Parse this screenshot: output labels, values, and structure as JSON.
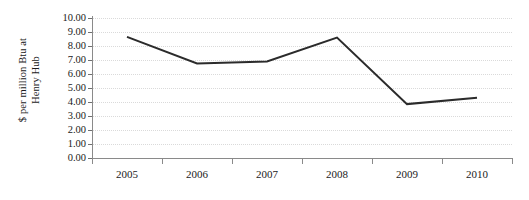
{
  "chart_data": {
    "type": "line",
    "title": "",
    "subtitle": "",
    "xlabel": "",
    "ylabel": "$ per million Btu at Henry Hub",
    "ylabel_lines": [
      "$ per million Btu at",
      "Henry Hub"
    ],
    "categories": [
      "2005",
      "2006",
      "2007",
      "2008",
      "2009",
      "2010"
    ],
    "series": [
      {
        "name": "Henry Hub natural gas price",
        "values": [
          8.65,
          6.75,
          6.9,
          8.6,
          3.85,
          4.3
        ],
        "color": "#2b2b2b"
      }
    ],
    "ylim": [
      0,
      10
    ],
    "ytick_step": 1,
    "ytick_labels": [
      "10.00",
      "9.00",
      "8.00",
      "7.00",
      "6.00",
      "5.00",
      "4.00",
      "3.00",
      "2.00",
      "1.00",
      "0.00"
    ],
    "ytick_values": [
      10,
      9,
      8,
      7,
      6,
      5,
      4,
      3,
      2,
      1,
      0
    ],
    "xtick_labels": [
      "2005",
      "2006",
      "2007",
      "2008",
      "2009",
      "2010"
    ],
    "grid": true,
    "grid_style": "dotted",
    "grid_color": "#dadada",
    "legend": false,
    "legend_position": "none",
    "axis_color": "#8a8a8a",
    "background": "#ffffff",
    "markers": false
  }
}
